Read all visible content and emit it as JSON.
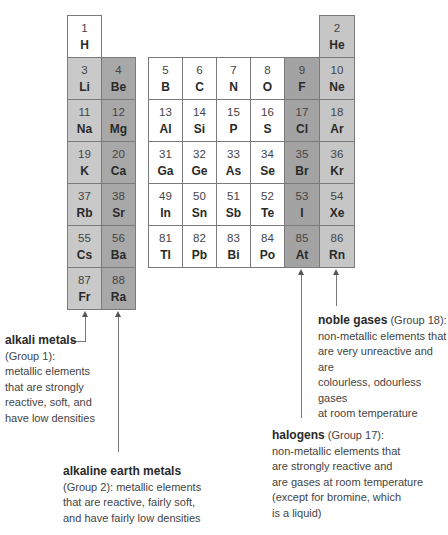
{
  "colors": {
    "group1": "#c9c9c9",
    "group2": "#a8a8a8",
    "other": "#ffffff",
    "halogen": "#a3a3a3",
    "noble": "#c6c6c6",
    "border": "#7a7a7a"
  },
  "elements": [
    {
      "n": "1",
      "s": "H",
      "col": 0,
      "row": 0,
      "g": "other"
    },
    {
      "n": "3",
      "s": "Li",
      "col": 0,
      "row": 1,
      "g": "group1"
    },
    {
      "n": "11",
      "s": "Na",
      "col": 0,
      "row": 2,
      "g": "group1"
    },
    {
      "n": "19",
      "s": "K",
      "col": 0,
      "row": 3,
      "g": "group1"
    },
    {
      "n": "37",
      "s": "Rb",
      "col": 0,
      "row": 4,
      "g": "group1"
    },
    {
      "n": "55",
      "s": "Cs",
      "col": 0,
      "row": 5,
      "g": "group1"
    },
    {
      "n": "87",
      "s": "Fr",
      "col": 0,
      "row": 6,
      "g": "group1"
    },
    {
      "n": "4",
      "s": "Be",
      "col": 1,
      "row": 1,
      "g": "group2"
    },
    {
      "n": "12",
      "s": "Mg",
      "col": 1,
      "row": 2,
      "g": "group2"
    },
    {
      "n": "20",
      "s": "Ca",
      "col": 1,
      "row": 3,
      "g": "group2"
    },
    {
      "n": "38",
      "s": "Sr",
      "col": 1,
      "row": 4,
      "g": "group2"
    },
    {
      "n": "56",
      "s": "Ba",
      "col": 1,
      "row": 5,
      "g": "group2"
    },
    {
      "n": "88",
      "s": "Ra",
      "col": 1,
      "row": 6,
      "g": "group2"
    },
    {
      "n": "5",
      "s": "B",
      "col": 2,
      "row": 1,
      "g": "other"
    },
    {
      "n": "13",
      "s": "Al",
      "col": 2,
      "row": 2,
      "g": "other"
    },
    {
      "n": "31",
      "s": "Ga",
      "col": 2,
      "row": 3,
      "g": "other"
    },
    {
      "n": "49",
      "s": "In",
      "col": 2,
      "row": 4,
      "g": "other"
    },
    {
      "n": "81",
      "s": "Tl",
      "col": 2,
      "row": 5,
      "g": "other"
    },
    {
      "n": "6",
      "s": "C",
      "col": 3,
      "row": 1,
      "g": "other"
    },
    {
      "n": "14",
      "s": "Si",
      "col": 3,
      "row": 2,
      "g": "other"
    },
    {
      "n": "32",
      "s": "Ge",
      "col": 3,
      "row": 3,
      "g": "other"
    },
    {
      "n": "50",
      "s": "Sn",
      "col": 3,
      "row": 4,
      "g": "other"
    },
    {
      "n": "82",
      "s": "Pb",
      "col": 3,
      "row": 5,
      "g": "other"
    },
    {
      "n": "7",
      "s": "N",
      "col": 4,
      "row": 1,
      "g": "other"
    },
    {
      "n": "15",
      "s": "P",
      "col": 4,
      "row": 2,
      "g": "other"
    },
    {
      "n": "33",
      "s": "As",
      "col": 4,
      "row": 3,
      "g": "other"
    },
    {
      "n": "51",
      "s": "Sb",
      "col": 4,
      "row": 4,
      "g": "other"
    },
    {
      "n": "83",
      "s": "Bi",
      "col": 4,
      "row": 5,
      "g": "other"
    },
    {
      "n": "8",
      "s": "O",
      "col": 5,
      "row": 1,
      "g": "other"
    },
    {
      "n": "16",
      "s": "S",
      "col": 5,
      "row": 2,
      "g": "other"
    },
    {
      "n": "34",
      "s": "Se",
      "col": 5,
      "row": 3,
      "g": "other"
    },
    {
      "n": "52",
      "s": "Te",
      "col": 5,
      "row": 4,
      "g": "other"
    },
    {
      "n": "84",
      "s": "Po",
      "col": 5,
      "row": 5,
      "g": "other"
    },
    {
      "n": "9",
      "s": "F",
      "col": 6,
      "row": 1,
      "g": "halogen"
    },
    {
      "n": "17",
      "s": "Cl",
      "col": 6,
      "row": 2,
      "g": "halogen"
    },
    {
      "n": "35",
      "s": "Br",
      "col": 6,
      "row": 3,
      "g": "halogen"
    },
    {
      "n": "53",
      "s": "I",
      "col": 6,
      "row": 4,
      "g": "halogen"
    },
    {
      "n": "85",
      "s": "At",
      "col": 6,
      "row": 5,
      "g": "halogen"
    },
    {
      "n": "2",
      "s": "He",
      "col": 7,
      "row": 0,
      "g": "noble"
    },
    {
      "n": "10",
      "s": "Ne",
      "col": 7,
      "row": 1,
      "g": "noble"
    },
    {
      "n": "18",
      "s": "Ar",
      "col": 7,
      "row": 2,
      "g": "noble"
    },
    {
      "n": "36",
      "s": "Kr",
      "col": 7,
      "row": 3,
      "g": "noble"
    },
    {
      "n": "54",
      "s": "Xe",
      "col": 7,
      "row": 4,
      "g": "noble"
    },
    {
      "n": "86",
      "s": "Rn",
      "col": 7,
      "row": 5,
      "g": "noble"
    }
  ],
  "labels": {
    "alkali": {
      "title": "alkali metals",
      "lines": [
        "(Group 1):",
        "metallic elements",
        "that are strongly",
        "reactive, soft, and",
        "have low densities"
      ]
    },
    "alkaline_earth": {
      "title": "alkaline earth metals",
      "lines": [
        "(Group 2): metallic elements",
        "that are reactive, fairly soft,",
        "and have fairly low densities"
      ]
    },
    "noble": {
      "title": "noble gases",
      "title_suffix": " (Group 18):",
      "lines": [
        "non-metallic elements that",
        "are very unreactive and are",
        "colourless, odourless gases",
        "at room temperature"
      ]
    },
    "halogens": {
      "title": "halogens",
      "title_suffix": " (Group 17):",
      "lines": [
        "non-metallic elements that",
        "are strongly reactive and",
        "are gases at room temperature",
        "(except for bromine, which",
        "is a liquid)"
      ]
    }
  }
}
